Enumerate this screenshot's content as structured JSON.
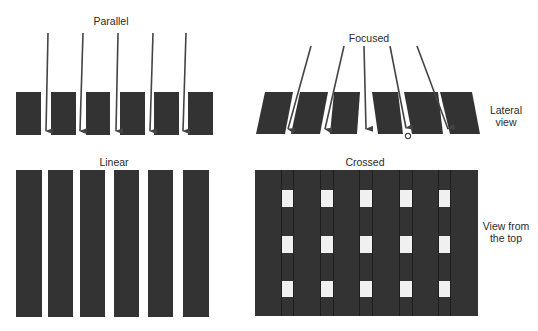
{
  "labels": {
    "parallel": "Parallel",
    "focused": "Focused",
    "linear": "Linear",
    "crossed": "Crossed",
    "lateral_view_1": "Lateral",
    "lateral_view_2": "view",
    "top_view_1": "View from",
    "top_view_2": "the top"
  },
  "colors": {
    "strip": "#333333",
    "arrow": "#444444",
    "background": "#ffffff",
    "gap": "#f0f0f0"
  },
  "panels": {
    "parallel": {
      "type": "lateral",
      "strip_count": 6,
      "arrow_count": 5
    },
    "focused": {
      "type": "lateral",
      "strip_count": 6,
      "arrow_count": 5,
      "focal_point_marker": "circle"
    },
    "linear": {
      "type": "top",
      "strip_count": 6
    },
    "crossed": {
      "type": "top",
      "hole_columns": 5,
      "hole_rows": 3
    }
  }
}
